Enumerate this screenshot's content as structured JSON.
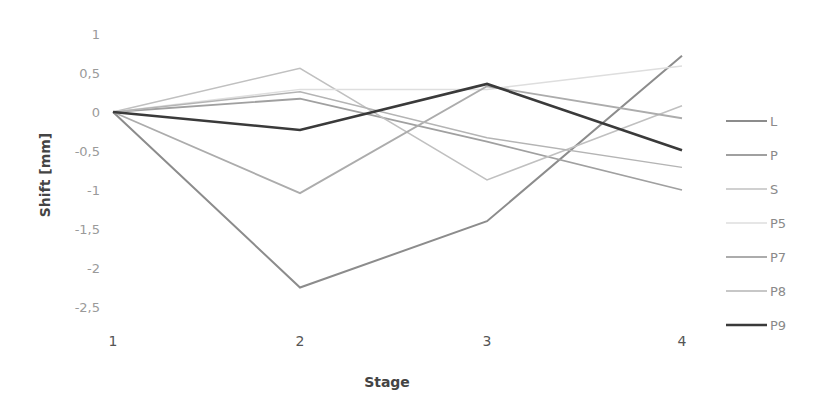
{
  "chart_data": {
    "type": "line",
    "title": "",
    "xlabel": "Stage",
    "ylabel": "Shift [mm]",
    "x": [
      1,
      2,
      3,
      4
    ],
    "x_tick_labels": [
      "1",
      "2",
      "3",
      "4"
    ],
    "y_tick_labels": [
      "1",
      "0,5",
      "0",
      "-0,5",
      "-1",
      "-1,5",
      "-2",
      "-2,5"
    ],
    "y_ticks": [
      1,
      0.5,
      0,
      -0.5,
      -1,
      -1.5,
      -2,
      -2.5
    ],
    "ylim": [
      -2.5,
      1
    ],
    "grid": false,
    "legend_position": "right",
    "series": [
      {
        "name": "L",
        "values": [
          0,
          -2.25,
          -1.4,
          0.72
        ],
        "color": "#8c8c8c",
        "width": 2
      },
      {
        "name": "P",
        "values": [
          0,
          0.17,
          -0.38,
          -1.0
        ],
        "color": "#a0a0a0",
        "width": 1.8
      },
      {
        "name": "S",
        "values": [
          0,
          0.56,
          -0.87,
          0.08
        ],
        "color": "#c0c0c0",
        "width": 1.5
      },
      {
        "name": "P5",
        "values": [
          0,
          0.29,
          0.29,
          0.59
        ],
        "color": "#dedede",
        "width": 1.5
      },
      {
        "name": "P7",
        "values": [
          0,
          -1.04,
          0.33,
          -0.08
        ],
        "color": "#acacac",
        "width": 1.8
      },
      {
        "name": "P8",
        "values": [
          0,
          0.26,
          -0.33,
          -0.71
        ],
        "color": "#b4b4b4",
        "width": 1.5
      },
      {
        "name": "P9",
        "values": [
          0,
          -0.23,
          0.36,
          -0.49
        ],
        "color": "#3a3a3a",
        "width": 2.6
      }
    ]
  }
}
